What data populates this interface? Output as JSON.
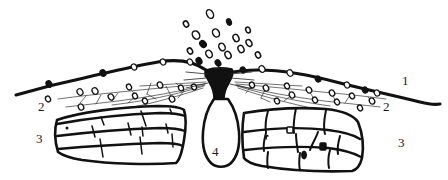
{
  "figure": {
    "background_color": "#ffffff",
    "ink_color": "#111111",
    "width": 448,
    "height": 180
  },
  "labels": [
    {
      "id": "label-1",
      "text": "1",
      "x": 402,
      "y": 74,
      "refers_to": "ground-surface-line"
    },
    {
      "id": "label-2-left",
      "text": "2",
      "x": 38,
      "y": 100,
      "refers_to": "clast-scatter-layer-left"
    },
    {
      "id": "label-2-right",
      "text": "2",
      "x": 383,
      "y": 100,
      "refers_to": "clast-scatter-layer-right"
    },
    {
      "id": "label-3-left",
      "text": "3",
      "x": 36,
      "y": 132,
      "refers_to": "stratified-rock-block-left"
    },
    {
      "id": "label-3-right",
      "text": "3",
      "x": 398,
      "y": 136,
      "refers_to": "stratified-rock-block-right"
    },
    {
      "id": "label-4",
      "text": "4",
      "x": 212,
      "y": 145,
      "refers_to": "central-vent-body"
    }
  ],
  "elements": {
    "ejecta_cloud": {
      "name": "ejecta-particle-cloud",
      "description": "Scattered small dark ellipses above the vent representing ejected fragments",
      "particle_count": 17,
      "particles": [
        {
          "cx": 210,
          "cy": 14,
          "rx": 3.2,
          "ry": 4.6,
          "rot": -28,
          "filled": false
        },
        {
          "cx": 229,
          "cy": 22,
          "rx": 2.2,
          "ry": 3.2,
          "rot": -20,
          "filled": true
        },
        {
          "cx": 196,
          "cy": 35,
          "rx": 3.4,
          "ry": 4.4,
          "rot": -35,
          "filled": false
        },
        {
          "cx": 216,
          "cy": 33,
          "rx": 3.2,
          "ry": 4.3,
          "rot": -30,
          "filled": false
        },
        {
          "cx": 236,
          "cy": 38,
          "rx": 2.8,
          "ry": 3.8,
          "rot": -25,
          "filled": false
        },
        {
          "cx": 249,
          "cy": 43,
          "rx": 2.6,
          "ry": 3.6,
          "rot": -32,
          "filled": false
        },
        {
          "cx": 203,
          "cy": 44,
          "rx": 2.8,
          "ry": 3.6,
          "rot": -40,
          "filled": true
        },
        {
          "cx": 222,
          "cy": 47,
          "rx": 3.0,
          "ry": 4.0,
          "rot": -28,
          "filled": false
        },
        {
          "cx": 241,
          "cy": 49,
          "rx": 2.8,
          "ry": 3.8,
          "rot": -26,
          "filled": false
        },
        {
          "cx": 190,
          "cy": 51,
          "rx": 2.4,
          "ry": 3.2,
          "rot": -30,
          "filled": false
        },
        {
          "cx": 209,
          "cy": 54,
          "rx": 3.0,
          "ry": 4.0,
          "rot": -30,
          "filled": false
        },
        {
          "cx": 228,
          "cy": 55,
          "rx": 2.8,
          "ry": 3.8,
          "rot": -28,
          "filled": false
        },
        {
          "cx": 199,
          "cy": 61,
          "rx": 2.6,
          "ry": 3.4,
          "rot": -30,
          "filled": true
        },
        {
          "cx": 218,
          "cy": 63,
          "rx": 2.4,
          "ry": 3.2,
          "rot": -35,
          "filled": true
        },
        {
          "cx": 248,
          "cy": 30,
          "rx": 2.2,
          "ry": 3.0,
          "rot": -22,
          "filled": false
        },
        {
          "cx": 186,
          "cy": 24,
          "rx": 2.4,
          "ry": 3.2,
          "rot": -30,
          "filled": false
        },
        {
          "cx": 258,
          "cy": 55,
          "rx": 2.4,
          "ry": 3.2,
          "rot": -28,
          "filled": false
        }
      ]
    },
    "ground_surface": {
      "name": "ground-surface-line",
      "description": "Thick irregular line forming a low broad mound peaking at the vent",
      "nodule_count": 12
    },
    "clast_layer": {
      "name": "clast-scatter-layer",
      "description": "Thin dashed lines radiating from the vent with small open ellipse clasts below the ground surface"
    },
    "rock_block_left": {
      "name": "stratified-rock-block-left",
      "description": "Lens-shaped block of three stratified layers with vertical joint cracks"
    },
    "rock_block_right": {
      "name": "stratified-rock-block-right",
      "description": "Lens-shaped block of two to three stratified layers with irregular joints and dark inclusions"
    },
    "vent": {
      "name": "central-vent-body",
      "description": "Solid black hourglass neck at surface opening into an elongated light oval body below"
    }
  }
}
